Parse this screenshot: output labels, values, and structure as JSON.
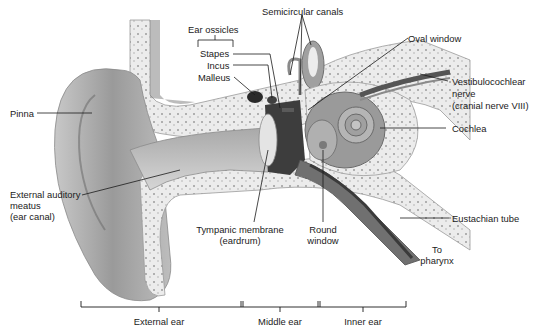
{
  "labels": {
    "ear_ossicles": "Ear ossicles",
    "stapes": "Stapes",
    "incus": "Incus",
    "malleus": "Malleus",
    "semicircular_canals": "Semicircular canals",
    "oval_window": "Oval window",
    "vestibulocochlear_nerve_1": "Vestibulocochlear",
    "vestibulocochlear_nerve_2": "nerve",
    "vestibulocochlear_nerve_3": "(cranial nerve VIII)",
    "cochlea": "Cochlea",
    "pinna": "Pinna",
    "external_auditory_meatus_1": "External auditory",
    "external_auditory_meatus_2": "meatus",
    "external_auditory_meatus_3": "(ear canal)",
    "tympanic_membrane_1": "Tympanic membrane",
    "tympanic_membrane_2": "(eardrum)",
    "round_window_1": "Round",
    "round_window_2": "window",
    "eustachian_tube": "Eustachian tube",
    "to_pharynx_1": "To",
    "to_pharynx_2": "pharynx"
  },
  "regions": [
    {
      "label": "External ear"
    },
    {
      "label": "Middle ear"
    },
    {
      "label": "Inner ear"
    }
  ],
  "colors": {
    "line": "#1a1a1a",
    "skin_dark": "#8a8a8a",
    "skin_light": "#d9d9d9",
    "bone": "#e8e8e8",
    "cochlea": "#9a9a9a"
  }
}
